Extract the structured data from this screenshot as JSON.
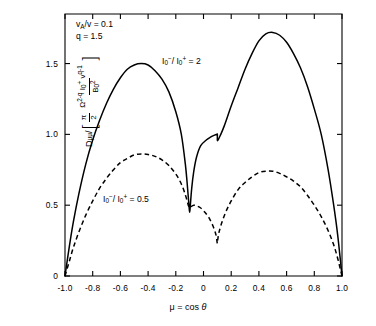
{
  "figure": {
    "background_color": "#ffffff",
    "line_color": "#000000"
  },
  "axes": {
    "x": {
      "label_mu": "μ",
      "label_eq": " = cos ",
      "label_theta": "θ",
      "label_full": "μ = cos θ",
      "ticks": [
        "-1.0",
        "-0.8",
        "-0.6",
        "-0.4",
        "-0.2",
        "0",
        "0.2",
        "0.4",
        "0.6",
        "0.8",
        "1.0"
      ],
      "tick_values": [
        -1.0,
        -0.8,
        -0.6,
        -0.4,
        -0.2,
        0,
        0.2,
        0.4,
        0.6,
        0.8,
        1.0
      ],
      "range": [
        -1.0,
        1.0
      ]
    },
    "y": {
      "ticks": [
        "0",
        "0.5",
        "1.0",
        "1.5"
      ],
      "tick_values": [
        0,
        0.5,
        1.0,
        1.5
      ],
      "range": [
        0,
        1.85
      ],
      "label_numerator_D": "D",
      "label_numerator_sub": "μμ",
      "label_slash": " / ",
      "label_pi": "π",
      "label_two": "2",
      "label_omega": "Ω",
      "label_omega_exp": "2-q",
      "label_I": "I",
      "label_I_sub": "0",
      "label_I_sup": "+",
      "label_v": "v",
      "label_v_exp": "q-1",
      "label_B": "B",
      "label_B_sub": "0",
      "label_B_sup": "2",
      "label_full": "Dμμ / [ (π/2) Ω^(2-q) I₀⁺ v^(q-1) / B₀² ]"
    }
  },
  "annotations": {
    "params": [
      {
        "name": "alfven-ratio",
        "symbol": "v",
        "sub": "A",
        "rest": "/v = 0.1",
        "text": "v_A/v = 0.1"
      },
      {
        "name": "spectral-index",
        "symbol": "q",
        "sub": "",
        "rest": " = 1.5",
        "text": "q = 1.5"
      }
    ],
    "curve_labels": [
      {
        "name": "solid-curve-label",
        "I": "I",
        "sub": "0",
        "sup_minus": "−",
        "slash": "/ I",
        "sup_plus": "+",
        "value": " = 2",
        "text": "I₀⁻/I₀⁺ = 2"
      },
      {
        "name": "dashed-curve-label",
        "I": "I",
        "sub": "0",
        "sup_minus": "−",
        "slash": "/ I",
        "sup_plus": "+",
        "value": " = 0.5",
        "text": "I₀⁻/I₀⁺ = 0.5"
      }
    ]
  },
  "chart_data": {
    "type": "line",
    "title": "",
    "xlabel": "μ = cos θ",
    "ylabel": "Dμμ / [ (π/2) Ω^(2-q) I₀⁺ v^(q-1) / B₀² ]",
    "xlim": [
      -1.0,
      1.0
    ],
    "ylim": [
      0,
      1.85
    ],
    "xticks": [
      -1.0,
      -0.8,
      -0.6,
      -0.4,
      -0.2,
      0,
      0.2,
      0.4,
      0.6,
      0.8,
      1.0
    ],
    "yticks": [
      0,
      0.5,
      1.0,
      1.5
    ],
    "grid": false,
    "legend_position": "inline-annotations",
    "annotations": [
      "v_A/v = 0.1",
      "q = 1.5"
    ],
    "series": [
      {
        "name": "I₀⁻/I₀⁺ = 2",
        "style": "solid",
        "color": "#000000",
        "x": [
          -1.0,
          -0.97,
          -0.94,
          -0.9,
          -0.85,
          -0.8,
          -0.75,
          -0.7,
          -0.65,
          -0.6,
          -0.55,
          -0.5,
          -0.45,
          -0.4,
          -0.35,
          -0.3,
          -0.25,
          -0.2,
          -0.16,
          -0.13,
          -0.115,
          -0.105,
          -0.1,
          -0.095,
          -0.085,
          -0.07,
          -0.05,
          -0.02,
          0.02,
          0.05,
          0.08,
          0.095,
          0.0999,
          0.1001,
          0.105,
          0.12,
          0.15,
          0.2,
          0.25,
          0.3,
          0.35,
          0.4,
          0.45,
          0.5,
          0.55,
          0.6,
          0.65,
          0.7,
          0.75,
          0.8,
          0.85,
          0.9,
          0.94,
          0.97,
          1.0
        ],
        "y": [
          0.0,
          0.2,
          0.38,
          0.58,
          0.79,
          0.96,
          1.1,
          1.22,
          1.32,
          1.4,
          1.46,
          1.49,
          1.5,
          1.49,
          1.45,
          1.39,
          1.3,
          1.16,
          1.0,
          0.78,
          0.62,
          0.5,
          0.45,
          0.5,
          0.62,
          0.74,
          0.84,
          0.92,
          0.96,
          0.98,
          0.995,
          1.0,
          1.0,
          0.96,
          0.96,
          0.99,
          1.06,
          1.2,
          1.33,
          1.46,
          1.57,
          1.66,
          1.71,
          1.72,
          1.7,
          1.65,
          1.57,
          1.47,
          1.34,
          1.18,
          1.0,
          0.75,
          0.5,
          0.28,
          0.0
        ]
      },
      {
        "name": "I₀⁻/I₀⁺ = 0.5",
        "style": "dashed",
        "color": "#000000",
        "x": [
          -1.0,
          -0.97,
          -0.94,
          -0.9,
          -0.85,
          -0.8,
          -0.75,
          -0.7,
          -0.65,
          -0.6,
          -0.55,
          -0.5,
          -0.45,
          -0.4,
          -0.35,
          -0.3,
          -0.25,
          -0.2,
          -0.16,
          -0.13,
          -0.11,
          -0.105,
          -0.1,
          -0.09,
          -0.07,
          -0.05,
          -0.02,
          0.01,
          0.04,
          0.07,
          0.09,
          0.098,
          0.1,
          0.102,
          0.11,
          0.13,
          0.16,
          0.2,
          0.25,
          0.3,
          0.35,
          0.4,
          0.45,
          0.5,
          0.55,
          0.6,
          0.65,
          0.7,
          0.75,
          0.8,
          0.85,
          0.9,
          0.94,
          0.97,
          1.0
        ],
        "y": [
          0.0,
          0.1,
          0.2,
          0.31,
          0.43,
          0.53,
          0.62,
          0.69,
          0.75,
          0.8,
          0.83,
          0.855,
          0.862,
          0.858,
          0.845,
          0.82,
          0.78,
          0.72,
          0.65,
          0.57,
          0.5,
          0.49,
          0.48,
          0.49,
          0.5,
          0.495,
          0.48,
          0.45,
          0.41,
          0.35,
          0.29,
          0.24,
          0.23,
          0.25,
          0.3,
          0.37,
          0.45,
          0.53,
          0.61,
          0.66,
          0.7,
          0.73,
          0.74,
          0.74,
          0.725,
          0.7,
          0.67,
          0.63,
          0.57,
          0.5,
          0.42,
          0.32,
          0.22,
          0.12,
          0.0
        ]
      }
    ]
  }
}
